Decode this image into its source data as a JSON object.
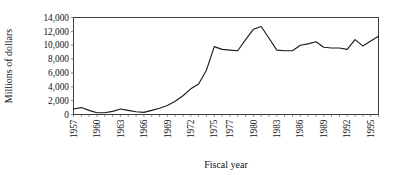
{
  "chart_data": {
    "type": "line",
    "title": "",
    "xlabel": "Fiscal year",
    "ylabel": "Millions of dollars",
    "xlim": [
      1957,
      1996
    ],
    "ylim": [
      0,
      14000
    ],
    "grid": false,
    "legend": null,
    "ytick_labels": [
      "14,000",
      "12,000",
      "10,000",
      "8,000",
      "6,000",
      "4,000",
      "2,000",
      "0"
    ],
    "ytick_values": [
      14000,
      12000,
      10000,
      8000,
      6000,
      4000,
      2000,
      0
    ],
    "xtick_labels": [
      "1957",
      "1960",
      "1963",
      "1966",
      "1969",
      "1972",
      "1975",
      "1977",
      "1980",
      "1983",
      "1986",
      "1989",
      "1992",
      "1995"
    ],
    "xtick_values": [
      1957,
      1960,
      1963,
      1966,
      1969,
      1972,
      1975,
      1977,
      1980,
      1983,
      1986,
      1989,
      1992,
      1995
    ],
    "x": [
      1957,
      1958,
      1959,
      1960,
      1961,
      1962,
      1963,
      1964,
      1965,
      1966,
      1967,
      1968,
      1969,
      1970,
      1971,
      1972,
      1973,
      1974,
      1975,
      1976,
      1977,
      1978,
      1979,
      1980,
      1981,
      1982,
      1983,
      1984,
      1985,
      1986,
      1987,
      1988,
      1989,
      1990,
      1991,
      1992,
      1993,
      1994,
      1995,
      1996
    ],
    "values": [
      800,
      1000,
      600,
      250,
      250,
      450,
      800,
      600,
      400,
      300,
      600,
      900,
      1300,
      1900,
      2700,
      3700,
      4400,
      6400,
      9800,
      9400,
      9300,
      9200,
      10800,
      12300,
      12700,
      11000,
      9300,
      9200,
      9200,
      10000,
      10200,
      10500,
      9700,
      9600,
      9600,
      9400,
      10800,
      9900,
      10600,
      11300
    ],
    "series_name": "Millions of dollars",
    "line_color": "#1c1c1c",
    "background_color": "#ffffff"
  },
  "figure": {
    "xlabel": "Fiscal year",
    "ylabel": "Millions of dollars"
  }
}
